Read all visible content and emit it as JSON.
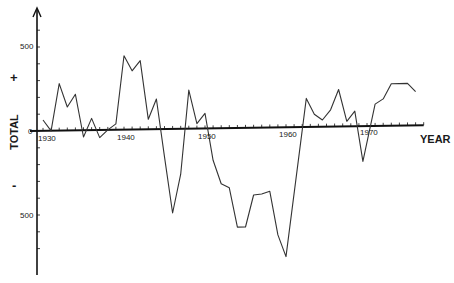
{
  "chart_data": {
    "type": "line",
    "title": "",
    "xlabel": "YEAR",
    "ylabel": "TOTAL",
    "y_positive_marker": "+",
    "y_negative_marker": "-",
    "x_tick_labels": [
      "1930",
      "1940",
      "1950",
      "1960",
      "1970"
    ],
    "y_tick_labels": [
      "500",
      "0",
      "500"
    ],
    "xlim": [
      1929,
      1978
    ],
    "ylim": [
      -850,
      650
    ],
    "grid": false,
    "legend": null,
    "series": [
      {
        "name": "TOTAL",
        "x": [
          1930,
          1931,
          1932,
          1933,
          1934,
          1935,
          1936,
          1937,
          1938,
          1939,
          1940,
          1941,
          1942,
          1943,
          1944,
          1945,
          1946,
          1947,
          1948,
          1949,
          1950,
          1951,
          1952,
          1953,
          1954,
          1955,
          1956,
          1957,
          1958,
          1959,
          1960,
          1962.5,
          1963.5,
          1964.5,
          1965.5,
          1966.5,
          1967.5,
          1968.5,
          1969.5,
          1971,
          1972,
          1973,
          1975,
          1976
        ],
        "values": [
          65,
          0,
          280,
          140,
          215,
          -40,
          70,
          -45,
          0,
          35,
          440,
          350,
          410,
          60,
          180,
          -165,
          -500,
          -270,
          230,
          30,
          90,
          -190,
          -330,
          -355,
          -590,
          -590,
          -400,
          -395,
          -380,
          -640,
          -770,
          170,
          75,
          40,
          100,
          220,
          30,
          90,
          -210,
          130,
          160,
          250,
          250,
          200
        ]
      }
    ]
  }
}
